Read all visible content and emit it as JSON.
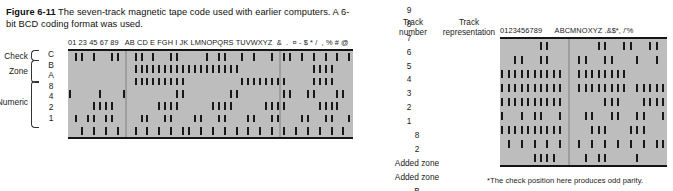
{
  "caption": {
    "lead": "Figure 6-11",
    "text": " The seven-track magnetic tape code used with earlier computers.  A 6-bit BCD coding format was used."
  },
  "left_diagram": {
    "header_chars": "01 23 45 67 89   AB CD E FGH I JK LMNOPQRS TUVWXYZ  &  .  ¤ - $ * /  , % # @",
    "row_labels": [
      "C",
      "B",
      "A",
      "8",
      "4",
      "2",
      "1"
    ],
    "group_labels": {
      "check": "Check",
      "zone": "Zone",
      "numeric": "Numeric"
    },
    "columns": 48,
    "segment_breaks": [
      10,
      36
    ],
    "rows": [
      {
        "label": "C",
        "marks": [
          1,
          2,
          4,
          7,
          8,
          11,
          12,
          14,
          17,
          18,
          23,
          25,
          26,
          29,
          31,
          34,
          36,
          37,
          39,
          41,
          43,
          45,
          47
        ]
      },
      {
        "label": "B",
        "marks": [
          11,
          12,
          13,
          14,
          15,
          16,
          17,
          18,
          19,
          20,
          21,
          22,
          23,
          24,
          25,
          26,
          27,
          28,
          41,
          42,
          43,
          44
        ]
      },
      {
        "label": "A",
        "marks": [
          11,
          12,
          13,
          14,
          15,
          16,
          17,
          18,
          19,
          29,
          30,
          31,
          32,
          33,
          34,
          35,
          36,
          41,
          42,
          43,
          44
        ]
      },
      {
        "label": "8",
        "marks": [
          0,
          5,
          9,
          18,
          19,
          27,
          28,
          36,
          37,
          40,
          41,
          45,
          46
        ]
      },
      {
        "label": "4",
        "marks": [
          4,
          5,
          6,
          7,
          15,
          16,
          17,
          18,
          24,
          25,
          26,
          27,
          33,
          34,
          35,
          36,
          42,
          43,
          44,
          45
        ]
      },
      {
        "label": "2",
        "marks": [
          1,
          3,
          4,
          6,
          7,
          12,
          13,
          16,
          17,
          21,
          22,
          25,
          26,
          30,
          31,
          34,
          35,
          39,
          40,
          43,
          44,
          47
        ]
      },
      {
        "label": "1",
        "marks": [
          2,
          4,
          6,
          8,
          11,
          13,
          15,
          17,
          19,
          20,
          22,
          24,
          26,
          28,
          30,
          32,
          34,
          36,
          38,
          40,
          42,
          44,
          46
        ]
      }
    ]
  },
  "right_table": {
    "col_headers": {
      "track_number": [
        "Track",
        "number"
      ],
      "track_representation": [
        "Track",
        "representation"
      ]
    },
    "track_numbers": [
      "9",
      "8",
      "7",
      "6",
      "5",
      "4",
      "3",
      "2",
      "1"
    ],
    "track_representation": [
      "8",
      "2",
      "Added zone",
      "Added zone",
      "B",
      "Check*",
      "A",
      "1",
      "4"
    ],
    "header_chars": "0123456789      ABCMNOXYZ .&$*, /'%",
    "columns": 26,
    "segment_breaks": [
      11
    ],
    "rows": [
      {
        "track": "9",
        "rep": "8",
        "marks": [
          6,
          7,
          15,
          16,
          19,
          20,
          23,
          24
        ]
      },
      {
        "track": "8",
        "rep": "2",
        "marks": [
          2,
          3,
          6,
          7,
          12,
          13,
          16,
          17,
          21,
          24
        ]
      },
      {
        "track": "7",
        "rep": "Added zone",
        "marks": [
          0,
          1,
          2,
          3,
          4,
          5,
          6,
          7,
          8,
          9,
          12,
          13,
          14,
          15,
          16,
          17,
          18,
          19
        ]
      },
      {
        "track": "6",
        "rep": "Added zone",
        "marks": [
          0,
          1,
          2,
          3,
          4,
          5,
          6,
          7,
          8,
          9,
          12,
          13,
          14,
          15,
          16,
          17,
          18,
          19,
          21,
          22,
          23,
          24,
          25
        ]
      },
      {
        "track": "5",
        "rep": "B",
        "marks": [
          0,
          1,
          2,
          3,
          4,
          5,
          6,
          7,
          8,
          9,
          16,
          17,
          18,
          22,
          23,
          24,
          25
        ]
      },
      {
        "track": "4",
        "rep": "Check*",
        "marks": [
          0,
          3,
          5,
          6,
          9,
          13,
          14,
          17,
          18,
          21,
          22,
          25
        ]
      },
      {
        "track": "3",
        "rep": "A",
        "marks": [
          0,
          1,
          2,
          3,
          4,
          5,
          6,
          7,
          8,
          9,
          14,
          15,
          16,
          20,
          21,
          22
        ]
      },
      {
        "track": "2",
        "rep": "1",
        "marks": [
          1,
          3,
          5,
          7,
          9,
          12,
          14,
          16,
          18,
          20,
          22,
          24,
          25
        ]
      },
      {
        "track": "1",
        "rep": "4",
        "marks": [
          5,
          6,
          7,
          8,
          13,
          15,
          16,
          21
        ]
      }
    ]
  },
  "footnote": "*The check position here produces odd parity."
}
